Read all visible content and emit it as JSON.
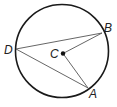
{
  "diagram": {
    "type": "circle-geometry",
    "circle": {
      "center": [
        62,
        51
      ],
      "radius": 46.5,
      "stroke": "#1a1a1a"
    },
    "center_point": {
      "label": "C",
      "x": 63,
      "y": 53.5
    },
    "points": [
      {
        "label": "D",
        "x": 16,
        "y": 49
      },
      {
        "label": "B",
        "x": 102,
        "y": 33
      },
      {
        "label": "A",
        "x": 88,
        "y": 88
      }
    ],
    "segments": [
      {
        "from": "D",
        "to": "B"
      },
      {
        "from": "D",
        "to": "A"
      },
      {
        "from": "C",
        "to": "B"
      },
      {
        "from": "C",
        "to": "A"
      }
    ],
    "labels": {
      "D": "D",
      "B": "B",
      "A": "A",
      "C": "C"
    },
    "line_color": "#555555"
  }
}
